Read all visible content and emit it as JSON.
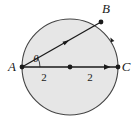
{
  "figure": {
    "name": "circle-with-inscribed-angle",
    "background_color": "#ffffff",
    "circle": {
      "fill_color": "#e6e6e6",
      "stroke_color": "#444444",
      "center_x": 70,
      "center_y": 67,
      "radius": 48
    },
    "points": [
      {
        "id": "A",
        "label": "A",
        "x": 22,
        "y": 67,
        "label_x": 12,
        "label_y": 71
      },
      {
        "id": "B",
        "label": "B",
        "x": 101,
        "y": 22,
        "label_x": 106,
        "label_y": 13
      },
      {
        "id": "C",
        "label": "C",
        "x": 118,
        "y": 67,
        "label_x": 124,
        "label_y": 71
      },
      {
        "id": "O",
        "label": "",
        "x": 70,
        "y": 67,
        "label_x": 70,
        "label_y": 67
      }
    ],
    "segments": [
      {
        "id": "AC",
        "from": "A",
        "to": "C",
        "has_arrow": true,
        "arrow_x": 108,
        "arrow_y": 67
      },
      {
        "id": "AB",
        "from": "A",
        "to": "B",
        "has_arrow": true,
        "arrow_x": 66,
        "arrow_y": 42
      }
    ],
    "angle": {
      "symbol": "θ",
      "at_point": "A",
      "label_x": 36,
      "label_y": 62
    },
    "measures": [
      {
        "id": "left-half",
        "text": "2",
        "x": 44,
        "y": 81
      },
      {
        "id": "right-half",
        "text": "2",
        "x": 90,
        "y": 81
      }
    ],
    "arc_ticks": [
      {
        "id": "arc-tick-right",
        "x": 112,
        "y": 40
      }
    ]
  }
}
